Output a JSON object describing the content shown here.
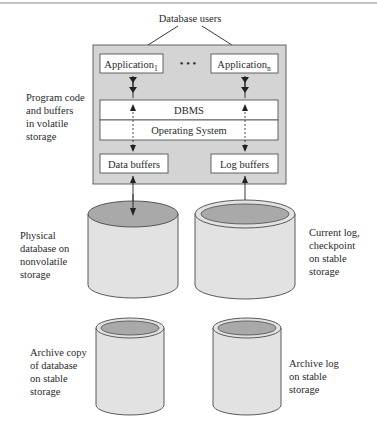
{
  "title": "Database users",
  "memory": {
    "label": "Program code\nand buffers\nin volatile\nstorage",
    "applications": [
      {
        "name": "Application",
        "subscript": "1"
      },
      {
        "name": "Application",
        "subscript": "n"
      }
    ],
    "ellipsis": "• • •",
    "dbms": "DBMS",
    "os": "Operating System",
    "data_buffers": "Data buffers",
    "log_buffers": "Log buffers"
  },
  "storage": {
    "physical_db": "Physical\ndatabase on\nnonvolatile\nstorage",
    "current_log": "Current log,\ncheckpoint\non stable\nstorage",
    "archive_db": "Archive copy\nof database\non stable\nstorage",
    "archive_log": "Archive log\non stable\nstorage"
  },
  "colors": {
    "panel": "#d4d4d4",
    "box": "#ffffff",
    "cylinder_body": "#e2e2e2",
    "cylinder_top": "#a9a9a9",
    "outline": "#4a4a4a"
  }
}
